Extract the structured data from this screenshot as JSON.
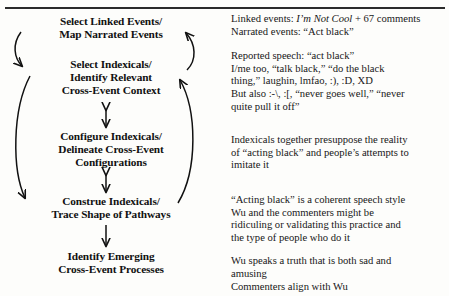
{
  "page": {
    "type": "scanned-book-figure",
    "background_color": "#fdfdfb",
    "ink_color": "#1a1a1a"
  },
  "diagram": {
    "orientation": "vertical-cycle",
    "nodes": [
      {
        "id": "select-linked-events",
        "lines": [
          "Select Linked Events/",
          "Map Narrated Events"
        ]
      },
      {
        "id": "select-indexicals",
        "lines": [
          "Select Indexicals/",
          "Identify Relevant",
          "Cross-Event Context"
        ]
      },
      {
        "id": "configure-indexicals",
        "lines": [
          "Configure Indexicals/",
          "Delineate Cross-Event",
          "Configurations"
        ]
      },
      {
        "id": "construe-indexicals",
        "lines": [
          "Construe Indexicals/",
          "Trace Shape of Pathways"
        ]
      },
      {
        "id": "identify-emerging",
        "lines": [
          "Identify Emerging",
          "Cross-Event Processes"
        ]
      }
    ],
    "connectors": [
      {
        "id": "curve-left-top",
        "from": "select-linked-events",
        "to": "select-indexicals",
        "style": "curved",
        "heads": "single"
      },
      {
        "id": "curve-right-top",
        "from": "select-indexicals",
        "to": "select-linked-events",
        "style": "curved",
        "heads": "single"
      },
      {
        "id": "double-arrow-upper",
        "from": "select-indexicals",
        "to": "configure-indexicals",
        "style": "straight",
        "heads": "double"
      },
      {
        "id": "double-arrow-lower",
        "from": "configure-indexicals",
        "to": "construe-indexicals",
        "style": "straight",
        "heads": "double"
      },
      {
        "id": "curve-left-long",
        "from": "select-indexicals",
        "to": "construe-indexicals",
        "style": "curved",
        "heads": "single"
      },
      {
        "id": "curve-right-long",
        "from": "construe-indexicals",
        "to": "select-indexicals",
        "style": "curved",
        "heads": "single"
      },
      {
        "id": "arrow-bottom",
        "from": "construe-indexicals",
        "to": "identify-emerging",
        "style": "straight",
        "heads": "single"
      }
    ]
  },
  "commentary": {
    "paragraphs": [
      {
        "id": "linked-narrated-events",
        "lines": [
          {
            "segments": [
              {
                "text": "Linked events: ",
                "style": "normal"
              },
              {
                "text": "I’m Not Cool",
                "style": "italic"
              },
              {
                "text": " + 67 comments",
                "style": "normal"
              }
            ]
          },
          {
            "segments": [
              {
                "text": "Narrated events: “Act black”",
                "style": "normal"
              }
            ]
          }
        ]
      },
      {
        "id": "reported-speech",
        "lines": [
          {
            "segments": [
              {
                "text": "Reported speech: “act black”",
                "style": "normal"
              }
            ]
          },
          {
            "segments": [
              {
                "text": "I/me too, “talk black,” “do the black",
                "style": "normal"
              }
            ]
          },
          {
            "segments": [
              {
                "text": "thing,” laughin, lmfao, :), :D, XD",
                "style": "normal"
              }
            ]
          },
          {
            "segments": [
              {
                "text": "But also :-\\, :[, “never goes well,” “never",
                "style": "normal"
              }
            ]
          },
          {
            "segments": [
              {
                "text": "quite pull it off”",
                "style": "normal"
              }
            ]
          }
        ]
      },
      {
        "id": "indexicals-presuppose",
        "lines": [
          {
            "segments": [
              {
                "text": "Indexicals together presuppose the reality",
                "style": "normal"
              }
            ]
          },
          {
            "segments": [
              {
                "text": "of “acting black” and people’s attempts to",
                "style": "normal"
              }
            ]
          },
          {
            "segments": [
              {
                "text": "imitate it",
                "style": "normal"
              }
            ]
          }
        ]
      },
      {
        "id": "acting-black-style",
        "lines": [
          {
            "segments": [
              {
                "text": "“Acting black” is a coherent speech style",
                "style": "normal"
              }
            ]
          },
          {
            "segments": [
              {
                "text": "Wu and the commenters might be",
                "style": "normal"
              }
            ]
          },
          {
            "segments": [
              {
                "text": "ridiculing or validating this practice and",
                "style": "normal"
              }
            ]
          },
          {
            "segments": [
              {
                "text": "the type of people who do it",
                "style": "normal"
              }
            ]
          }
        ]
      },
      {
        "id": "wu-speaks-truth",
        "lines": [
          {
            "segments": [
              {
                "text": "Wu speaks a truth that is both sad and",
                "style": "normal"
              }
            ]
          },
          {
            "segments": [
              {
                "text": "amusing",
                "style": "normal"
              }
            ]
          },
          {
            "segments": [
              {
                "text": "Commenters align with Wu",
                "style": "normal"
              }
            ]
          }
        ]
      }
    ]
  }
}
